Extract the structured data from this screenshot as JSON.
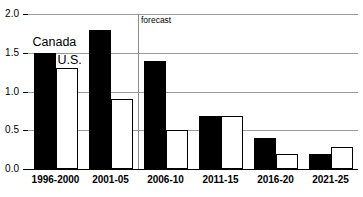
{
  "chart_data": {
    "type": "bar",
    "title": "",
    "xlabel": "",
    "ylabel": "",
    "ylim": [
      0.0,
      2.0
    ],
    "ytick_values": [
      2.0,
      1.5,
      1.0,
      0.5,
      0.0
    ],
    "ytick_labels": [
      "2.0",
      "1.5",
      "1.0",
      "0.5",
      "0.0"
    ],
    "grid": true,
    "legend_position": "inline-annotation",
    "categories": [
      "1996-2000",
      "2001-05",
      "2006-10",
      "2011-15",
      "2016-20",
      "2021-25"
    ],
    "series": [
      {
        "name": "Canada",
        "style": "solid-black",
        "color": "#000000",
        "values": [
          1.5,
          1.8,
          1.4,
          0.69,
          0.4,
          0.19
        ]
      },
      {
        "name": "U.S.",
        "style": "white-outlined",
        "color": "#ffffff",
        "values": [
          1.3,
          0.9,
          0.5,
          0.69,
          0.2,
          0.29
        ]
      }
    ],
    "annotations": [
      {
        "name": "forecast-divider",
        "label": "forecast",
        "after_category": "2001-05",
        "type": "vertical-line"
      },
      {
        "name": "canada-series-label",
        "label": "Canada",
        "type": "inline-series-label"
      },
      {
        "name": "us-series-label",
        "label": "U.S.",
        "type": "inline-series-label"
      }
    ]
  },
  "axes": {
    "y_ticks": [
      {
        "label": "2.0"
      },
      {
        "label": "1.5"
      },
      {
        "label": "1.0"
      },
      {
        "label": "0.5"
      },
      {
        "label": "0.0"
      }
    ],
    "x_categories": [
      {
        "label": "1996-2000"
      },
      {
        "label": "2001-05"
      },
      {
        "label": "2006-10"
      },
      {
        "label": "2011-15"
      },
      {
        "label": "2016-20"
      },
      {
        "label": "2021-25"
      }
    ]
  },
  "labels": {
    "canada": "Canada",
    "us": "U.S.",
    "forecast": "forecast",
    "title_cropped": ""
  },
  "colors": {
    "canada_bar": "#000000",
    "us_bar": "#ffffff",
    "gridline": "#9a9a9a",
    "axis": "#000000",
    "forecast_line": "#8c8c8c",
    "background": "#ffffff"
  }
}
